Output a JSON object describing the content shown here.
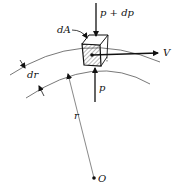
{
  "diagram": {
    "type": "fluid-element-on-curved-streamline",
    "labels": {
      "top_pressure": "p + dp",
      "bottom_pressure": "p",
      "area": "dA",
      "velocity": "V",
      "thickness": "dr",
      "radius": "r",
      "center": "O"
    },
    "colors": {
      "line": "#111111",
      "background": "#ffffff"
    }
  }
}
